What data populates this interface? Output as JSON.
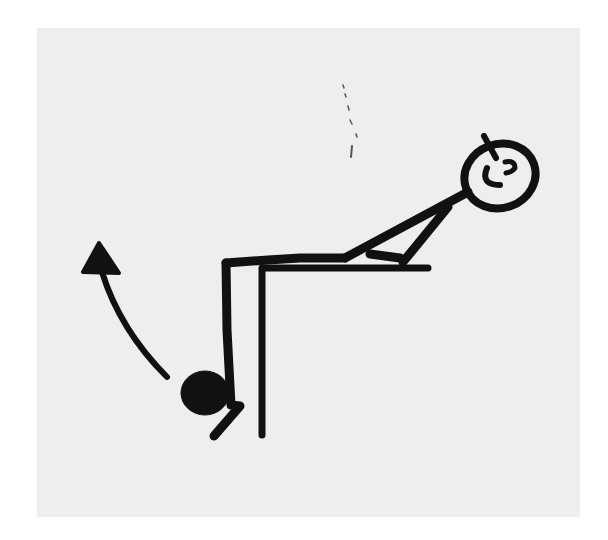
{
  "illustration": {
    "description": "Stick-figure exercise illustration: person leaning back on a table edge, lower leg hanging down with a round ankle weight; curved arrow indicates lifting the leg up",
    "colors": {
      "background": "#ffffff",
      "panel": "#eeeeee",
      "ink": "#111111"
    },
    "elements": [
      "head-with-smile",
      "torso",
      "arm-support",
      "thigh",
      "lower-leg",
      "ankle-weight",
      "table-top",
      "table-leg",
      "lift-arrow",
      "dotted-mark"
    ]
  }
}
